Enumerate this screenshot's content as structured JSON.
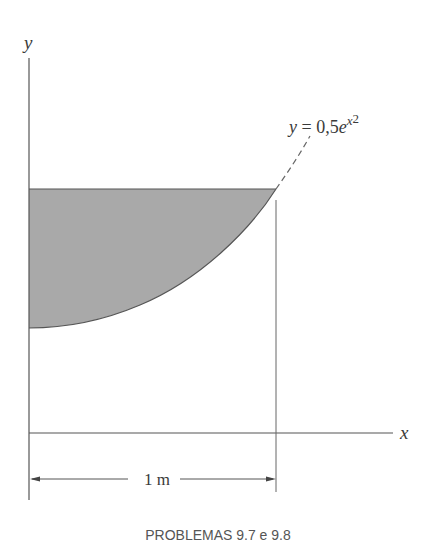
{
  "diagram": {
    "axes": {
      "y_label": "y",
      "x_label": "x"
    },
    "curve": {
      "equation_prefix": "y = 0,5e",
      "equation_exponent": "x",
      "equation_power": "2",
      "style": "dashed extension beyond region"
    },
    "shaded_region": {
      "description": "Area bounded by y-axis, horizontal line at top, and curve y = 0,5e^(x^2)",
      "fill_color": "#a9a9a9"
    },
    "dimension": {
      "label": "1 m"
    },
    "caption": "PROBLEMAS 9.7 e 9.8",
    "colors": {
      "line": "#555555",
      "shade": "#a9a9a9",
      "background": "#ffffff"
    }
  }
}
